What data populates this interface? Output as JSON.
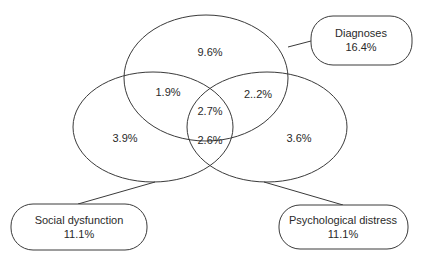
{
  "diagram": {
    "type": "venn",
    "sets": [
      {
        "key": "diagnoses",
        "label": "Diagnoses",
        "total": "16.4%"
      },
      {
        "key": "social",
        "label": "Social dysfunction",
        "total": "11.1%"
      },
      {
        "key": "psych",
        "label": "Psychological distress",
        "total": "11.1%"
      }
    ],
    "regions": {
      "diagnoses_only": "9.6%",
      "diagnoses_social": "1.9%",
      "diagnoses_psych": "2..2%",
      "all_three": "2.7%",
      "social_only": "3.9%",
      "social_psych": "2.6%",
      "psych_only": "3.6%"
    },
    "colors": {
      "stroke": "#3a3a3a",
      "text": "#2a2a2a",
      "background": "#ffffff"
    }
  }
}
